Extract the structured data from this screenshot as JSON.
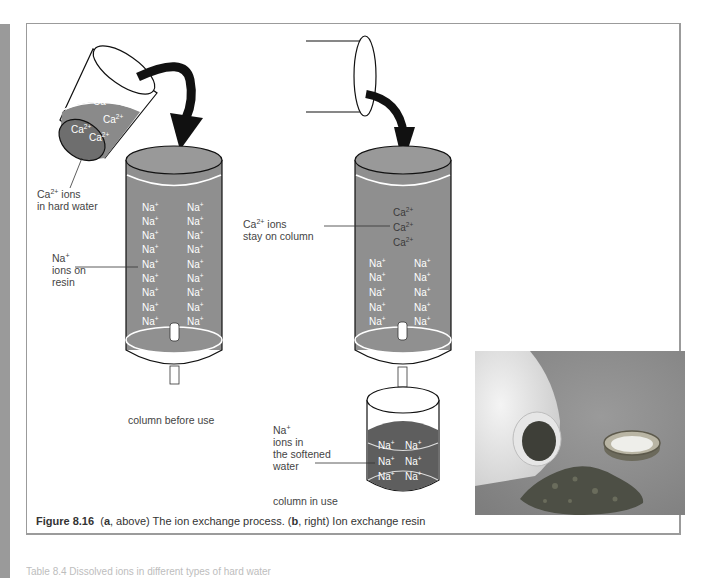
{
  "figure": {
    "number": "Figure 8.16",
    "caption_part_a_letter": "a",
    "caption_part_a_text": ", above) The ion exchange process. (",
    "caption_part_b_letter": "b",
    "caption_part_b_text": ", right) Ion exchange resin",
    "caption_open": "("
  },
  "diagram_a": {
    "beaker_ions": [
      "Ca",
      "Ca",
      "Ca",
      "Ca"
    ],
    "beaker_ion_charge": "2+",
    "label_hard_water_ion": "Ca",
    "label_hard_water_charge": "2+",
    "label_hard_water_line1": " ions",
    "label_hard_water_line2": "in hard water",
    "label_resin_ion": "Na",
    "label_resin_charge": "+",
    "label_resin_line2": "ions on",
    "label_resin_line3": "resin",
    "column_ion": "Na",
    "column_ion_charge": "+",
    "column_rows": 9,
    "column_caption": "column before use"
  },
  "diagram_b": {
    "label_stay_ion": "Ca",
    "label_stay_charge": "2+",
    "label_stay_line1": " ions",
    "label_stay_line2": "stay on column",
    "ca_ion": "Ca",
    "ca_charge": "2+",
    "na_ion": "Na",
    "na_charge": "+",
    "label_softened_ion": "Na",
    "label_softened_charge": "+",
    "label_softened_line2": "ions in",
    "label_softened_line3": "the softened",
    "label_softened_line4": "water",
    "column_caption": "column in use"
  },
  "photo": {
    "subject": "Ion exchange resin spilled from a white plastic bottle beside a metal cap"
  },
  "colors": {
    "solution_grey": "#8a8a8a",
    "dark_solution": "#5a5a5a",
    "frame": "#9b9b9b",
    "side_strip": "#9a9a9a"
  },
  "bottom_text": "Table 8.4  Dissolved ions in different types of hard water"
}
